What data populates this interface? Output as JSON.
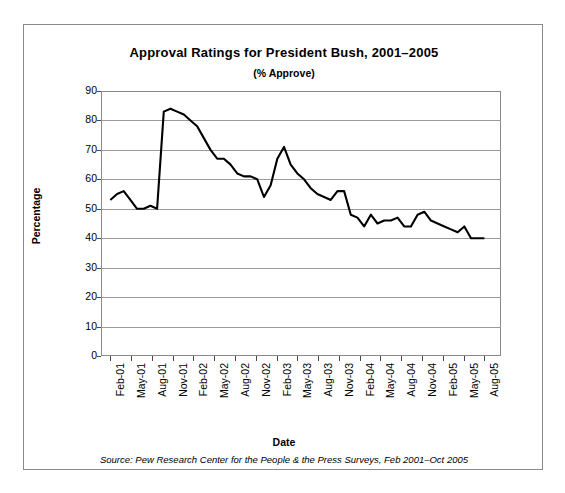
{
  "chart_data": {
    "type": "line",
    "title": "Approval Ratings for President Bush, 2001–2005",
    "subtitle": "(% Approve)",
    "xlabel": "Date",
    "ylabel": "Percentage",
    "ylim": [
      0,
      90
    ],
    "ytick_step": 10,
    "yticks": [
      "90",
      "80",
      "70",
      "60",
      "50",
      "40",
      "30",
      "20",
      "10",
      "0"
    ],
    "grid": "horizontal",
    "legend": "none",
    "source_note": "Source: Pew Research Center for the People & the Press Surveys, Feb 2001–Oct 2005",
    "xticks": [
      "Feb-01",
      "May-01",
      "Aug-01",
      "Nov-01",
      "Feb-02",
      "May-02",
      "Aug-02",
      "Nov-02",
      "Feb-03",
      "May-03",
      "Aug-03",
      "Nov-03",
      "Feb-04",
      "May-04",
      "Aug-04",
      "Nov-04",
      "Feb-05",
      "May-05",
      "Aug-05"
    ],
    "series": [
      {
        "name": "% Approve",
        "line_color": "#000000",
        "x": [
          "Feb-01",
          "Mar-01",
          "Apr-01",
          "May-01",
          "Jun-01",
          "Jul-01",
          "Aug-01",
          "Sep-01",
          "Oct-01",
          "Nov-01",
          "Dec-01",
          "Jan-02",
          "Feb-02",
          "Mar-02",
          "Apr-02",
          "May-02",
          "Jun-02",
          "Jul-02",
          "Aug-02",
          "Sep-02",
          "Oct-02",
          "Nov-02",
          "Dec-02",
          "Jan-03",
          "Feb-03",
          "Mar-03",
          "Apr-03",
          "May-03",
          "Jun-03",
          "Jul-03",
          "Aug-03",
          "Sep-03",
          "Oct-03",
          "Nov-03",
          "Dec-03",
          "Jan-04",
          "Feb-04",
          "Mar-04",
          "Apr-04",
          "May-04",
          "Jun-04",
          "Jul-04",
          "Aug-04",
          "Sep-04",
          "Oct-04",
          "Nov-04",
          "Dec-04",
          "Jan-05",
          "Feb-05",
          "Mar-05",
          "Apr-05",
          "May-05",
          "Jun-05",
          "Jul-05",
          "Aug-05",
          "Sep-05",
          "Oct-05"
        ],
        "values": [
          53,
          55,
          56,
          53,
          50,
          50,
          51,
          50,
          83,
          84,
          83,
          82,
          80,
          78,
          74,
          70,
          67,
          67,
          65,
          62,
          61,
          61,
          60,
          54,
          58,
          67,
          71,
          65,
          62,
          60,
          57,
          55,
          54,
          53,
          56,
          56,
          48,
          47,
          44,
          48,
          45,
          46,
          46,
          47,
          44,
          44,
          48,
          49,
          46,
          45,
          44,
          43,
          42,
          44,
          40,
          40,
          40
        ]
      }
    ]
  }
}
